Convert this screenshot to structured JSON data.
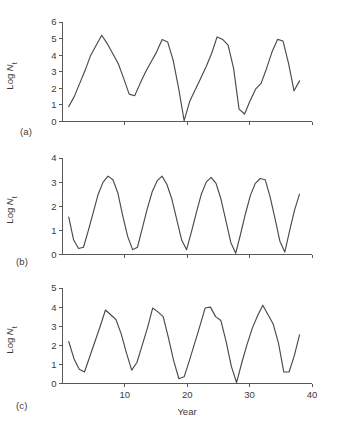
{
  "figure": {
    "panel_labels": {
      "a": "(a)",
      "b": "(b)",
      "c": "(c)"
    },
    "line_color": "#4a4a4a",
    "axis_color": "#595959",
    "background": "#ffffff"
  },
  "chart_data": [
    {
      "type": "line",
      "panel": "(a)",
      "title": "",
      "xlabel": "",
      "ylabel": "Log N_t",
      "ylabel_parts": {
        "main": "Log ",
        "italic": "N",
        "subscript": "t"
      },
      "xlim": [
        0,
        40
      ],
      "ylim": [
        0,
        6
      ],
      "yticks": [
        0,
        1,
        2,
        3,
        4,
        5,
        6
      ],
      "ytick_labels": [
        "0",
        "1",
        "2",
        "3",
        "4",
        "5",
        "6"
      ],
      "xticks": [
        10,
        20,
        30,
        40
      ],
      "xtick_labels": [
        "",
        "",
        "",
        ""
      ],
      "grid": false,
      "legend": "none",
      "x": [
        1,
        2,
        3,
        4,
        5,
        6,
        7,
        8,
        9,
        10,
        11,
        12,
        13,
        14,
        15,
        16,
        17,
        18,
        19,
        20,
        21,
        22,
        23,
        24,
        25,
        26,
        27,
        28,
        29,
        30,
        31,
        32,
        33,
        34,
        35,
        36,
        37,
        38
      ],
      "values": [
        0.9,
        1.5,
        2.3,
        3.1,
        4.0,
        4.6,
        5.2,
        4.7,
        4.1,
        3.5,
        2.6,
        1.65,
        1.55,
        2.3,
        3.0,
        3.6,
        4.2,
        4.95,
        4.8,
        3.7,
        2.0,
        0.05,
        1.2,
        1.9,
        2.6,
        3.3,
        4.1,
        5.1,
        4.95,
        4.6,
        3.2,
        0.75,
        0.45,
        1.25,
        1.95,
        2.3,
        3.2,
        4.2,
        4.95,
        4.85,
        3.5,
        1.85,
        2.45
      ]
    },
    {
      "type": "line",
      "panel": "(b)",
      "title": "",
      "xlabel": "",
      "ylabel": "Log N_t",
      "ylabel_parts": {
        "main": "Log ",
        "italic": "N",
        "subscript": "t"
      },
      "xlim": [
        0,
        40
      ],
      "ylim": [
        0,
        4
      ],
      "yticks": [
        0,
        1,
        2,
        3,
        4
      ],
      "ytick_labels": [
        "0",
        "1",
        "2",
        "3",
        "4"
      ],
      "xticks": [
        10,
        20,
        30,
        40
      ],
      "xtick_labels": [
        "",
        "",
        "",
        ""
      ],
      "grid": false,
      "legend": "none",
      "x": [
        1,
        2,
        3,
        4,
        5,
        6,
        7,
        8,
        9,
        10,
        11,
        12,
        13,
        14,
        15,
        16,
        17,
        18,
        19,
        20,
        21,
        22,
        23,
        24,
        25,
        26,
        27,
        28,
        29,
        30,
        31,
        32,
        33,
        34,
        35,
        36,
        37,
        38
      ],
      "values": [
        1.55,
        0.6,
        0.25,
        0.3,
        1.0,
        1.75,
        2.5,
        3.0,
        3.25,
        3.1,
        2.55,
        1.6,
        0.75,
        0.2,
        0.3,
        1.1,
        1.9,
        2.6,
        3.05,
        3.25,
        2.9,
        2.3,
        1.45,
        0.6,
        0.2,
        0.95,
        1.75,
        2.5,
        3.0,
        3.2,
        2.95,
        2.3,
        1.4,
        0.5,
        0.05,
        0.85,
        1.7,
        2.45,
        2.95,
        3.15,
        3.1,
        2.4,
        1.5,
        0.55,
        0.1,
        1.0,
        1.85,
        2.5
      ]
    },
    {
      "type": "line",
      "panel": "(c)",
      "title": "",
      "xlabel": "Year",
      "ylabel": "Log N_t",
      "ylabel_parts": {
        "main": "Log ",
        "italic": "N",
        "subscript": "t"
      },
      "xlim": [
        0,
        40
      ],
      "ylim": [
        0,
        5
      ],
      "yticks": [
        0,
        1,
        2,
        3,
        4,
        5
      ],
      "ytick_labels": [
        "0",
        "1",
        "2",
        "3",
        "4",
        "5"
      ],
      "xticks": [
        10,
        20,
        30,
        40
      ],
      "xtick_labels": [
        "10",
        "20",
        "30",
        "40"
      ],
      "grid": false,
      "legend": "none",
      "x": [
        1,
        2,
        3,
        4,
        5,
        6,
        7,
        8,
        9,
        10,
        11,
        12,
        13,
        14,
        15,
        16,
        17,
        18,
        19,
        20,
        21,
        22,
        23,
        24,
        25,
        26,
        27,
        28,
        29,
        30,
        31,
        32,
        33,
        34,
        35,
        36,
        37,
        38
      ],
      "values": [
        2.2,
        1.3,
        0.75,
        0.6,
        1.4,
        2.2,
        3.0,
        3.85,
        3.6,
        3.35,
        2.6,
        1.6,
        0.7,
        1.1,
        2.0,
        2.9,
        3.95,
        3.75,
        3.5,
        2.4,
        1.2,
        0.25,
        0.35,
        1.2,
        2.1,
        3.0,
        3.95,
        4.0,
        3.5,
        3.3,
        2.2,
        0.9,
        0.05,
        1.1,
        2.05,
        2.9,
        3.55,
        4.1,
        3.6,
        3.1,
        2.1,
        0.6,
        0.6,
        1.45,
        2.55
      ]
    }
  ]
}
